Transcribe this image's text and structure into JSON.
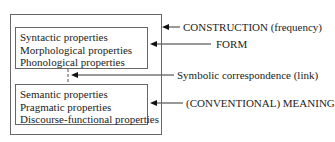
{
  "diagram": {
    "form_box": {
      "items": [
        "Syntactic properties",
        "Morphological properties",
        "Phonological properties"
      ]
    },
    "meaning_box": {
      "items": [
        "Semantic  properties",
        "Pragmatic properties",
        "Discourse-functional properties"
      ]
    },
    "labels": {
      "construction": "CONSTRUCTION (frequency)",
      "form": "FORM",
      "link": "Symbolic correspondence (link)",
      "meaning": "(CONVENTIONAL) MEANING"
    }
  }
}
